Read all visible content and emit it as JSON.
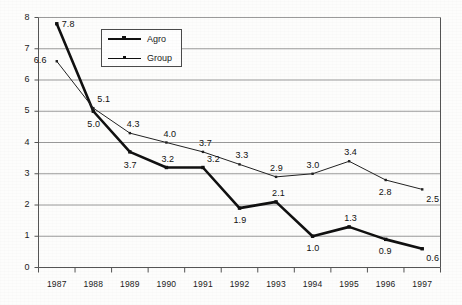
{
  "chart_data": {
    "type": "line",
    "title": "",
    "xlabel": "",
    "ylabel": "",
    "categories": [
      "1987",
      "1988",
      "1989",
      "1990",
      "1991",
      "1992",
      "1993",
      "1994",
      "1995",
      "1996",
      "1997"
    ],
    "series": [
      {
        "name": "Agro",
        "style": "thick",
        "values": [
          7.8,
          5.0,
          3.7,
          3.2,
          3.2,
          1.9,
          2.1,
          1.0,
          1.3,
          0.9,
          0.6
        ],
        "labels": [
          "7.8",
          "5.0",
          "3.7",
          "3.2",
          "3.2",
          "1.9",
          "2.1",
          "1.0",
          "1.3",
          "0.9",
          "0.6"
        ],
        "label_offsets": [
          {
            "dx": 5,
            "dy": -5
          },
          {
            "dx": -6,
            "dy": 8
          },
          {
            "dx": -6,
            "dy": 8
          },
          {
            "dx": -5,
            "dy": -14
          },
          {
            "dx": 4,
            "dy": -14
          },
          {
            "dx": -6,
            "dy": 7
          },
          {
            "dx": -4,
            "dy": -14
          },
          {
            "dx": -6,
            "dy": 7
          },
          {
            "dx": -5,
            "dy": -14
          },
          {
            "dx": -7,
            "dy": 7
          },
          {
            "dx": 4,
            "dy": 4
          }
        ]
      },
      {
        "name": "Group",
        "style": "thin",
        "values": [
          6.6,
          5.1,
          4.3,
          4.0,
          3.7,
          3.3,
          2.9,
          3.0,
          3.4,
          2.8,
          2.5
        ],
        "labels": [
          "6.6",
          "5.1",
          "4.3",
          "4.0",
          "3.7",
          "3.3",
          "2.9",
          "3.0",
          "3.4",
          "2.8",
          "2.5"
        ],
        "label_offsets": [
          {
            "dx": -23,
            "dy": -6
          },
          {
            "dx": 4,
            "dy": -14
          },
          {
            "dx": -3,
            "dy": -14
          },
          {
            "dx": -3,
            "dy": -14
          },
          {
            "dx": -4,
            "dy": -14
          },
          {
            "dx": -4,
            "dy": -14
          },
          {
            "dx": -6,
            "dy": -14
          },
          {
            "dx": -6,
            "dy": -14
          },
          {
            "dx": -5,
            "dy": -14
          },
          {
            "dx": -7,
            "dy": 7
          },
          {
            "dx": 4,
            "dy": 5
          }
        ]
      }
    ],
    "ylim": [
      0,
      8
    ],
    "yticks": [
      "0",
      "1",
      "2",
      "3",
      "4",
      "5",
      "6",
      "7",
      "8"
    ],
    "grid": true,
    "legend": {
      "position": "top-left-inside",
      "entries": [
        {
          "label": "Agro",
          "style": "thick"
        },
        {
          "label": "Group",
          "style": "thin"
        }
      ]
    },
    "colors": {
      "series_agro": "#111111",
      "series_group": "#222222",
      "grid": "#9a9a9a",
      "axis": "#555555",
      "background": "#fdfdfc",
      "text": "#1b1b1b"
    }
  }
}
